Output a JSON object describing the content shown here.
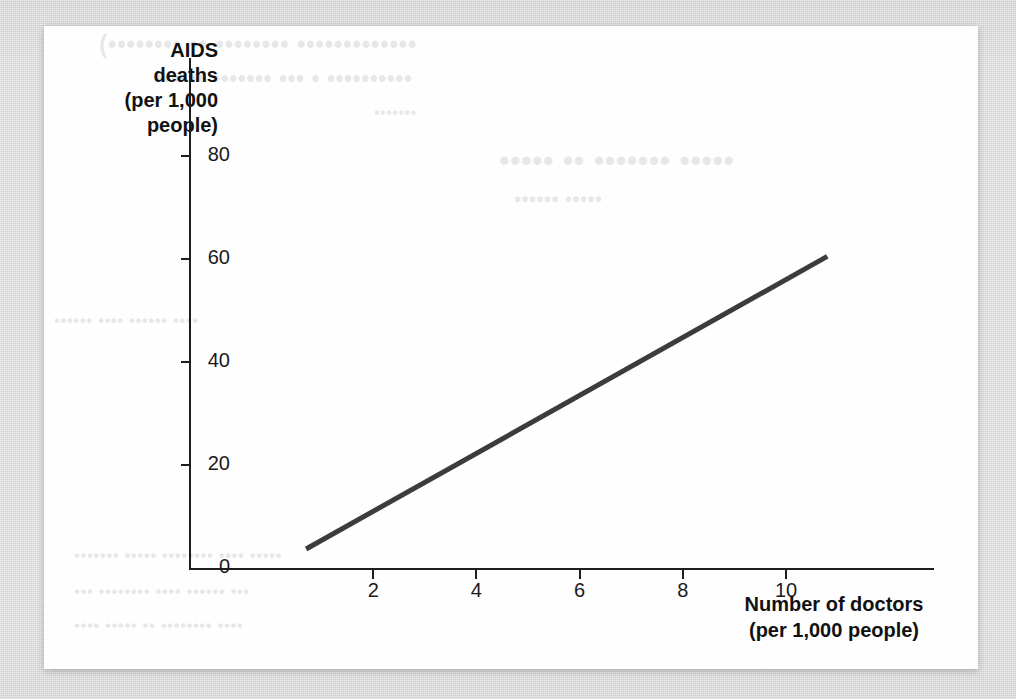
{
  "figure": {
    "background_color": "#d7d7d7",
    "card_color": "#fefefe",
    "ink_color": "#1a1a1a",
    "series_color": "#3c3c3c"
  },
  "chart_data": {
    "type": "line",
    "title": "",
    "xlabel": "Number of doctors (per 1,000 people)",
    "xlabel_line1": "Number of doctors",
    "xlabel_line2": "(per 1,000 people)",
    "ylabel": "AIDS deaths (per 1,000 people)",
    "ylabel_line1": "AIDS",
    "ylabel_line2": "deaths",
    "ylabel_line3": "(per 1,000",
    "ylabel_line4": "people)",
    "xlim": [
      0,
      12.4
    ],
    "ylim": [
      0,
      88
    ],
    "xticks": [
      2,
      4,
      6,
      8,
      10
    ],
    "yticks": [
      0,
      20,
      40,
      60,
      80
    ],
    "xtick_labels": [
      "2",
      "4",
      "6",
      "8",
      "10"
    ],
    "ytick_labels": [
      "0",
      "20",
      "40",
      "60",
      "80"
    ],
    "grid": false,
    "legend": false,
    "series": [
      {
        "name": "AIDS deaths vs doctors",
        "line_width_px": 5,
        "color": "#3c3c3c",
        "x": [
          0.7,
          10.8
        ],
        "y": [
          3.7,
          60.5
        ]
      }
    ],
    "annotations": []
  },
  "bleed_through": {
    "note": "faint illegible show-through text from reverse page",
    "lines": [
      "(•••••••• •• •••••••• •••••••••••••",
      "•••••• ••••••• ••• • ••••••••••",
      "•••••••",
      "••••• •• ••••••• •••••",
      "•••••• •••••",
      "•••••• •••• •••••• ••••",
      "••••••• ••••• •••••••• •••• •••••",
      "••• •••••••• •••• •••••• •••",
      "•••• ••••• •• •••••••• ••••"
    ]
  }
}
